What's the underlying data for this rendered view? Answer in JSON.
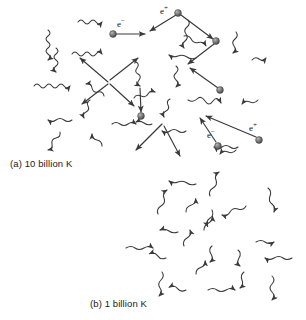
{
  "figure": {
    "background_color": "#ffffff",
    "ink_color": "#3a3a3a",
    "particle_color": "#6e6e6e",
    "width": 306,
    "height": 320
  },
  "panels": [
    {
      "id": "a",
      "caption": "(a) 10 billion K",
      "temperature_value": 10,
      "temperature_unit": "billion K",
      "contents": "electrons, positrons and photons",
      "bounds": {
        "x": 0,
        "y": 0,
        "width": 306,
        "height": 172
      }
    },
    {
      "id": "b",
      "caption": "(b) 1 billion K",
      "temperature_value": 1,
      "temperature_unit": "billion K",
      "contents": "photons only",
      "bounds": {
        "x": 0,
        "y": 172,
        "width": 306,
        "height": 148
      }
    }
  ],
  "particle_labels": [
    {
      "name": "electron",
      "symbol": "e",
      "charge": "−",
      "x": 120,
      "y": 23
    },
    {
      "name": "positron",
      "symbol": "e",
      "charge": "+",
      "x": 163,
      "y": 10
    },
    {
      "name": "electron",
      "symbol": "e",
      "charge": "−",
      "x": 211,
      "y": 133
    },
    {
      "name": "positron",
      "symbol": "e",
      "charge": "+",
      "x": 252,
      "y": 126
    }
  ],
  "particles": [
    {
      "type": "electron",
      "x": 113,
      "y": 34
    },
    {
      "type": "positron",
      "x": 178,
      "y": 13
    },
    {
      "type": "positron",
      "x": 216,
      "y": 41
    },
    {
      "type": "particle",
      "x": 220,
      "y": 90
    },
    {
      "type": "particle",
      "x": 141,
      "y": 116
    },
    {
      "type": "electron",
      "x": 218,
      "y": 146
    },
    {
      "type": "positron",
      "x": 259,
      "y": 140
    }
  ],
  "photon_count_panel_a": 22,
  "photon_count_panel_b": 20,
  "legend_note": "straight arrows = massive particles, wavy arrows = photons"
}
